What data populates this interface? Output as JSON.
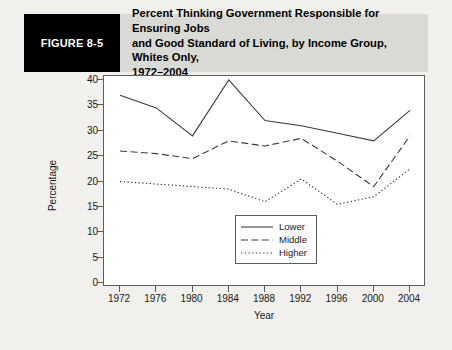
{
  "figure": {
    "number_label": "FIGURE 8-5",
    "title_line1": "Percent Thinking Government Responsible for Ensuring Jobs",
    "title_line2": "and Good Standard of Living, by Income Group, Whites Only,",
    "title_line3": "1972–2004"
  },
  "colors": {
    "header_bar": "#000000",
    "header_band": "#d9d9d6",
    "page_background": "#f2f0ec",
    "plot_background": "#ffffff",
    "axis": "#5d5d5d",
    "series_line": "#3c3c3c"
  },
  "chart_data": {
    "type": "line",
    "title": "Percent Thinking Government Responsible for Ensuring Jobs and Good Standard of Living, by Income Group, Whites Only, 1972–2004",
    "xlabel": "Year",
    "ylabel": "Percentage",
    "x": [
      1972,
      1976,
      1980,
      1984,
      1988,
      1992,
      1996,
      2000,
      2004
    ],
    "categories": [
      "1972",
      "1976",
      "1980",
      "1984",
      "1988",
      "1992",
      "1996",
      "2000",
      "2004"
    ],
    "xlim": [
      1972,
      2004
    ],
    "ylim": [
      0,
      40
    ],
    "yticks": [
      0,
      5,
      10,
      15,
      20,
      25,
      30,
      35,
      40
    ],
    "grid": false,
    "legend_position": "bottom-right",
    "series": [
      {
        "name": "Lower",
        "style": "solid",
        "values": [
          37,
          34.5,
          29,
          40,
          32,
          31,
          29.5,
          28,
          34
        ]
      },
      {
        "name": "Middle",
        "style": "dashed",
        "values": [
          26,
          25.5,
          24.5,
          28,
          27,
          28.5,
          24,
          19,
          29
        ]
      },
      {
        "name": "Higher",
        "style": "dotted",
        "values": [
          20,
          19.5,
          19,
          18.5,
          16,
          20.5,
          15.5,
          17,
          22.5
        ]
      }
    ]
  }
}
